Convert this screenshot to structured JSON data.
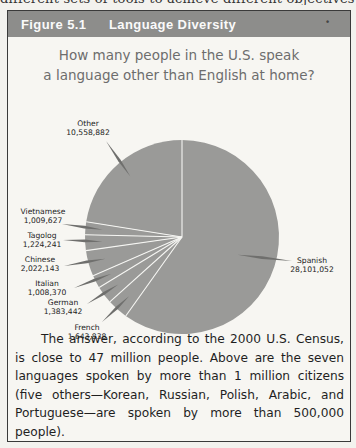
{
  "page": {
    "top_strip_text": "different sets of tools to achieve different objectives in"
  },
  "figure": {
    "number": "Figure 5.1",
    "title": "Language Diversity",
    "question_line1": "How many people in the U.S. speak",
    "question_line2": "a language other than English at home?",
    "caption": "The answer, according to the 2000 U.S. Census, is close to 47 million people. Above are the seven languages spoken by more than 1 million citizens (five others—Korean, Russian, Polish, Arabic, and Portuguese—are spoken by more than 500,000 people)."
  },
  "colors": {
    "header_bg": "#8d8d8b",
    "pie_fill": "#9a9a98",
    "slice_divider": "#f5f5f2",
    "leader_line": "#6f6f6d"
  },
  "chart_data": {
    "type": "pie",
    "title": "How many people in the U.S. speak a language other than English at home?",
    "start_angle_deg": 0,
    "direction": "counterclockwise",
    "categories": [
      "Other",
      "Vietnamese",
      "Tagolog",
      "Chinese",
      "Italian",
      "German",
      "French",
      "Spanish"
    ],
    "values": [
      10558882,
      1009627,
      1224241,
      2022143,
      1008370,
      1383442,
      1643838,
      28101052
    ],
    "labels": [
      {
        "name": "Other",
        "value": "10,558,882",
        "x": 88,
        "y": 126,
        "anchor": "middle",
        "lx": 106,
        "ly": 141
      },
      {
        "name": "Vietnamese",
        "value": "1,009,627",
        "x": 43,
        "y": 214,
        "anchor": "middle",
        "lx": 62,
        "ly": 224
      },
      {
        "name": "Tagolog",
        "value": "1,224,241",
        "x": 42,
        "y": 238,
        "anchor": "middle",
        "lx": 63,
        "ly": 240
      },
      {
        "name": "Chinese",
        "value": "2,022,143",
        "x": 40,
        "y": 262,
        "anchor": "middle",
        "lx": 64,
        "ly": 266
      },
      {
        "name": "Italian",
        "value": "1,008,370",
        "x": 47,
        "y": 286,
        "anchor": "middle",
        "lx": 74,
        "ly": 288
      },
      {
        "name": "German",
        "value": "1,383,442",
        "x": 63,
        "y": 305,
        "anchor": "middle",
        "lx": 87,
        "ly": 304
      },
      {
        "name": "French",
        "value": "1,643,838",
        "x": 87,
        "y": 330,
        "anchor": "middle",
        "lx": 102,
        "ly": 322
      },
      {
        "name": "Spanish",
        "value": "28,101,052",
        "x": 312,
        "y": 263,
        "anchor": "middle",
        "lx": 292,
        "ly": 261
      }
    ],
    "xlabel": "",
    "ylabel": "",
    "legend": "none (direct labels)"
  }
}
